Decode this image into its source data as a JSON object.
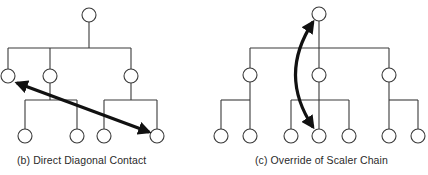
{
  "colors": {
    "line": "#3a3a3a",
    "arrow": "#111111",
    "node_fill": "#ffffff",
    "background": "#ffffff"
  },
  "panels": [
    {
      "id": "b",
      "caption": "(b) Direct Diagonal Contact",
      "node_radius": 7,
      "nodes": [
        {
          "id": "top",
          "x": 89,
          "y": 15
        },
        {
          "id": "l2a",
          "x": 8,
          "y": 76
        },
        {
          "id": "l2b",
          "x": 50,
          "y": 76
        },
        {
          "id": "l2c",
          "x": 131,
          "y": 76
        },
        {
          "id": "l3a",
          "x": 25,
          "y": 136
        },
        {
          "id": "l3b",
          "x": 77,
          "y": 136
        },
        {
          "id": "l3c",
          "x": 104,
          "y": 136
        },
        {
          "id": "l3d",
          "x": 157,
          "y": 136
        }
      ],
      "lines": [
        [
          89,
          22,
          89,
          48
        ],
        [
          8,
          48,
          131,
          48
        ],
        [
          8,
          48,
          8,
          69
        ],
        [
          50,
          48,
          50,
          69
        ],
        [
          131,
          48,
          131,
          69
        ],
        [
          50,
          83,
          50,
          100
        ],
        [
          25,
          100,
          77,
          100
        ],
        [
          25,
          100,
          25,
          129
        ],
        [
          77,
          100,
          77,
          129
        ],
        [
          131,
          83,
          131,
          100
        ],
        [
          104,
          100,
          157,
          100
        ],
        [
          104,
          100,
          104,
          129
        ],
        [
          157,
          100,
          157,
          129
        ]
      ],
      "arrow": {
        "type": "double-straight",
        "from": [
          17,
          83
        ],
        "to": [
          149,
          132
        ]
      }
    },
    {
      "id": "c",
      "caption": "(c) Override of Scaler Chain",
      "node_radius": 7,
      "nodes": [
        {
          "id": "top",
          "x": 319,
          "y": 14
        },
        {
          "id": "l2a",
          "x": 250,
          "y": 75
        },
        {
          "id": "l2b",
          "x": 319,
          "y": 75
        },
        {
          "id": "l2c",
          "x": 389,
          "y": 75
        },
        {
          "id": "l3a",
          "x": 221,
          "y": 136
        },
        {
          "id": "l3b",
          "x": 250,
          "y": 136
        },
        {
          "id": "l3c",
          "x": 291,
          "y": 136
        },
        {
          "id": "l3d",
          "x": 319,
          "y": 136
        },
        {
          "id": "l3e",
          "x": 349,
          "y": 136
        },
        {
          "id": "l3f",
          "x": 389,
          "y": 136
        },
        {
          "id": "l3g",
          "x": 418,
          "y": 136
        }
      ],
      "lines": [
        [
          319,
          21,
          319,
          48
        ],
        [
          250,
          48,
          389,
          48
        ],
        [
          250,
          48,
          250,
          68
        ],
        [
          319,
          48,
          319,
          68
        ],
        [
          389,
          48,
          389,
          68
        ],
        [
          250,
          82,
          250,
          100
        ],
        [
          221,
          100,
          250,
          100
        ],
        [
          221,
          100,
          221,
          129
        ],
        [
          250,
          100,
          250,
          129
        ],
        [
          319,
          82,
          319,
          100
        ],
        [
          291,
          100,
          349,
          100
        ],
        [
          291,
          100,
          291,
          129
        ],
        [
          319,
          100,
          319,
          129
        ],
        [
          349,
          100,
          349,
          129
        ],
        [
          389,
          82,
          389,
          100
        ],
        [
          389,
          100,
          418,
          100
        ],
        [
          418,
          100,
          418,
          129
        ],
        [
          389,
          100,
          389,
          129
        ]
      ],
      "arrow": {
        "type": "double-curved",
        "from": [
          313,
          127
        ],
        "to": [
          313,
          22
        ],
        "control": [
          278,
          75
        ]
      }
    }
  ]
}
